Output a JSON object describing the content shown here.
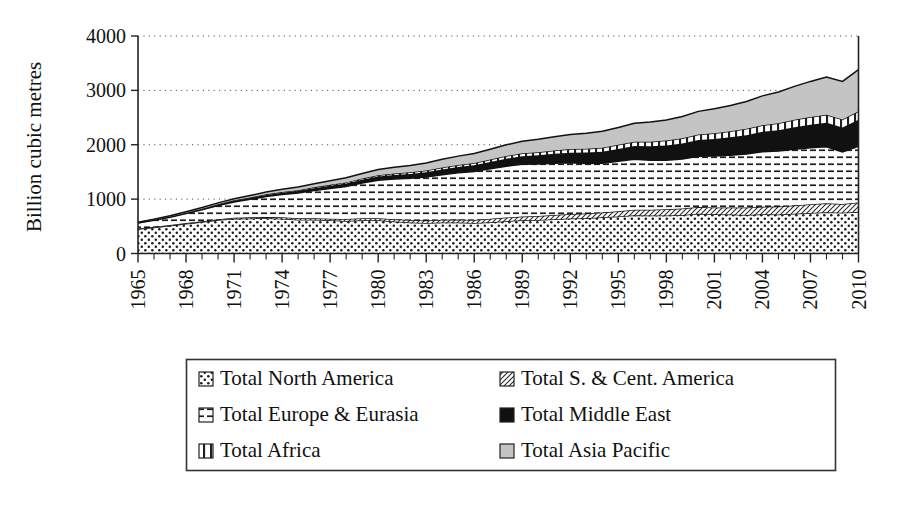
{
  "chart_data": {
    "type": "area",
    "title": "",
    "subtitle": "",
    "xlabel": "",
    "ylabel": "Billion cubic metres",
    "ylim": [
      0,
      4000
    ],
    "yticks": [
      0,
      1000,
      2000,
      3000,
      4000
    ],
    "ytick_labels": [
      "0",
      "1000",
      "2000",
      "3000",
      "4000"
    ],
    "xlim": [
      1965,
      2010
    ],
    "xticks": [
      1965,
      1968,
      1971,
      1974,
      1977,
      1980,
      1983,
      1986,
      1989,
      1992,
      1995,
      1998,
      2001,
      2004,
      2007,
      2010
    ],
    "xtick_labels": [
      "1965",
      "1968",
      "1971",
      "1974",
      "1977",
      "1980",
      "1983",
      "1986",
      "1989",
      "1992",
      "1995",
      "1998",
      "2001",
      "2004",
      "2007",
      "2010"
    ],
    "grid": "horizontal-dotted",
    "stacked": true,
    "legend_position": "below",
    "x": [
      1965,
      1966,
      1967,
      1968,
      1969,
      1970,
      1971,
      1972,
      1973,
      1974,
      1975,
      1976,
      1977,
      1978,
      1979,
      1980,
      1981,
      1982,
      1983,
      1984,
      1985,
      1986,
      1987,
      1988,
      1989,
      1990,
      1991,
      1992,
      1993,
      1994,
      1995,
      1996,
      1997,
      1998,
      1999,
      2000,
      2001,
      2002,
      2003,
      2004,
      2005,
      2006,
      2007,
      2008,
      2009,
      2010
    ],
    "series": [
      {
        "name": "Total North America",
        "pattern": "dotted",
        "values": [
          450,
          480,
          510,
          545,
          580,
          615,
          640,
          645,
          650,
          640,
          620,
          620,
          610,
          600,
          610,
          610,
          590,
          570,
          560,
          570,
          570,
          560,
          575,
          595,
          610,
          615,
          630,
          645,
          650,
          665,
          680,
          705,
          700,
          700,
          710,
          730,
          720,
          715,
          710,
          720,
          715,
          730,
          745,
          760,
          750,
          770
        ]
      },
      {
        "name": "Total S. & Cent. America",
        "pattern": "fine-diagonal",
        "values": [
          10,
          11,
          12,
          14,
          15,
          17,
          19,
          21,
          23,
          25,
          27,
          29,
          31,
          33,
          36,
          39,
          42,
          44,
          47,
          50,
          54,
          58,
          62,
          66,
          70,
          74,
          78,
          82,
          86,
          90,
          95,
          100,
          106,
          112,
          118,
          124,
          128,
          132,
          136,
          142,
          148,
          154,
          160,
          166,
          162,
          170
        ]
      },
      {
        "name": "Total Europe & Eurasia",
        "pattern": "horizontal-dash",
        "values": [
          100,
          120,
          145,
          175,
          210,
          250,
          290,
          330,
          375,
          420,
          465,
          510,
          555,
          600,
          650,
          700,
          740,
          770,
          800,
          830,
          860,
          890,
          920,
          945,
          960,
          955,
          950,
          940,
          920,
          905,
          920,
          930,
          910,
          905,
          910,
          935,
          945,
          960,
          985,
          1010,
          1020,
          1035,
          1040,
          1035,
          955,
          1030
        ]
      },
      {
        "name": "Total Middle East",
        "pattern": "solid-black",
        "values": [
          6,
          8,
          10,
          12,
          14,
          17,
          20,
          24,
          28,
          32,
          37,
          42,
          48,
          54,
          60,
          66,
          73,
          80,
          88,
          96,
          105,
          115,
          126,
          138,
          150,
          162,
          175,
          188,
          200,
          212,
          225,
          240,
          255,
          270,
          285,
          300,
          315,
          330,
          345,
          365,
          385,
          405,
          425,
          445,
          450,
          490
        ]
      },
      {
        "name": "Total Africa",
        "pattern": "vertical-bar",
        "values": [
          2,
          3,
          4,
          5,
          6,
          7,
          9,
          10,
          12,
          13,
          15,
          17,
          19,
          21,
          23,
          25,
          28,
          30,
          33,
          36,
          39,
          42,
          46,
          50,
          54,
          58,
          62,
          66,
          70,
          74,
          78,
          82,
          86,
          90,
          95,
          100,
          105,
          110,
          116,
          122,
          128,
          134,
          140,
          146,
          148,
          155
        ]
      },
      {
        "name": "Total Asia Pacific",
        "pattern": "light-grey",
        "values": [
          8,
          10,
          13,
          16,
          20,
          25,
          30,
          36,
          42,
          50,
          58,
          66,
          75,
          84,
          94,
          105,
          115,
          126,
          138,
          150,
          163,
          176,
          190,
          205,
          220,
          236,
          252,
          268,
          285,
          302,
          320,
          340,
          360,
          380,
          400,
          425,
          450,
          475,
          505,
          540,
          575,
          615,
          655,
          695,
          700,
          765
        ]
      }
    ],
    "totals": [
      576,
      632,
      694,
      767,
      845,
      931,
      1008,
      1066,
      1130,
      1180,
      1222,
      1284,
      1338,
      1392,
      1473,
      1545,
      1588,
      1620,
      1666,
      1732,
      1791,
      1841,
      1919,
      1999,
      2064,
      2100,
      2147,
      2189,
      2211,
      2248,
      2318,
      2397,
      2417,
      2457,
      2518,
      2614,
      2663,
      2722,
      2797,
      2899,
      2971,
      3073,
      3165,
      3247,
      3165,
      3380
    ]
  },
  "axis": {
    "ylabel": "Billion cubic metres"
  },
  "legend": {
    "items": [
      {
        "label": "Total North America",
        "pattern": "dotted"
      },
      {
        "label": "Total S. & Cent. America",
        "pattern": "fine-diagonal"
      },
      {
        "label": "Total Europe & Eurasia",
        "pattern": "horizontal-dash"
      },
      {
        "label": "Total Middle East",
        "pattern": "solid-black"
      },
      {
        "label": "Total Africa",
        "pattern": "vertical-bar"
      },
      {
        "label": "Total Asia Pacific",
        "pattern": "light-grey"
      }
    ]
  },
  "colors": {
    "axis": "#222222",
    "grid": "#555555",
    "middle_east": "#111111",
    "asia_pacific": "#c4c4c4",
    "background": "#ffffff"
  }
}
